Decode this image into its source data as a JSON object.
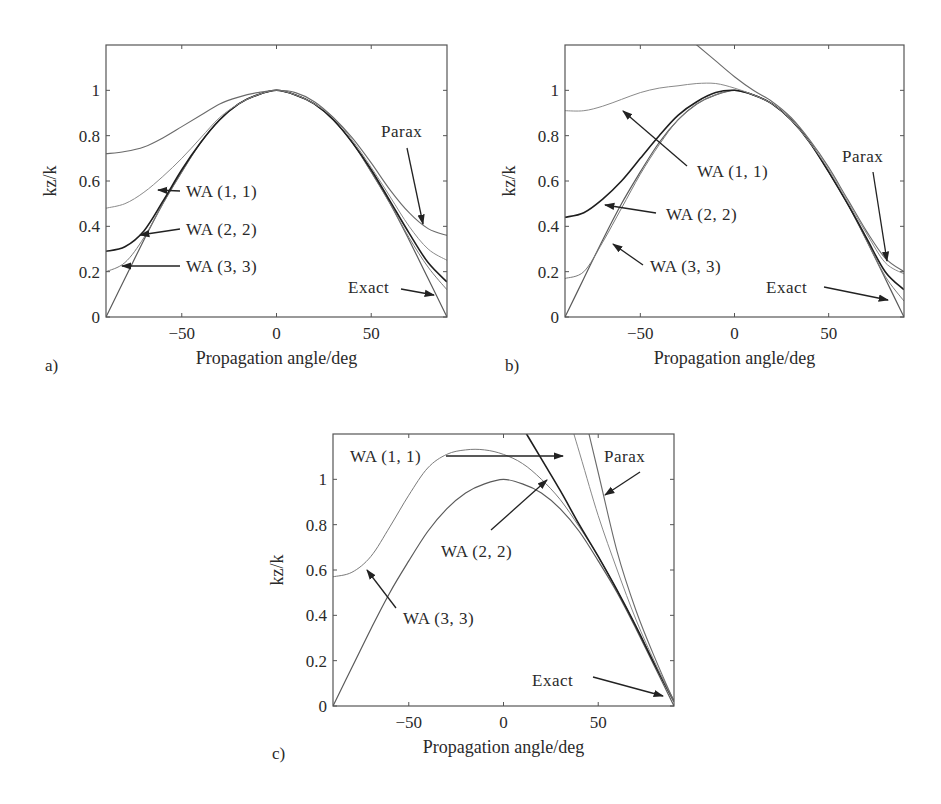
{
  "figure": {
    "panels": [
      {
        "id": "a",
        "letter": "a)",
        "xlabel": "Propagation angle/deg",
        "ylabel": "kz/k"
      },
      {
        "id": "b",
        "letter": "b)",
        "xlabel": "Propagation angle/deg",
        "ylabel": "kz/k"
      },
      {
        "id": "c",
        "letter": "c)",
        "xlabel": "Propagation angle/deg",
        "ylabel": "kz/k"
      }
    ]
  },
  "chart_data": [
    {
      "type": "line",
      "panel": "a)",
      "title": "",
      "xlabel": "Propagation angle/deg",
      "ylabel": "kz/k",
      "xlim": [
        -90,
        90
      ],
      "ylim": [
        0,
        1.2
      ],
      "xticks": [
        -50,
        0,
        50
      ],
      "yticks": [
        0,
        0.2,
        0.4,
        0.6,
        0.8,
        1
      ],
      "ytick_labels": [
        "0",
        "0.2",
        "0.4",
        "0.6",
        "0.8",
        "1"
      ],
      "grid": false,
      "x": [
        -90,
        -80,
        -70,
        -60,
        -50,
        -40,
        -30,
        -20,
        -10,
        0,
        10,
        20,
        30,
        40,
        50,
        60,
        70,
        80,
        90
      ],
      "series": [
        {
          "name": "Exact",
          "values": [
            0.0,
            0.17,
            0.34,
            0.5,
            0.64,
            0.77,
            0.87,
            0.94,
            0.98,
            1.0,
            0.98,
            0.94,
            0.87,
            0.77,
            0.64,
            0.5,
            0.34,
            0.17,
            0.0
          ]
        },
        {
          "name": "WA (3, 3)",
          "values": [
            0.2,
            0.24,
            0.35,
            0.5,
            0.64,
            0.77,
            0.87,
            0.94,
            0.98,
            1.0,
            0.98,
            0.94,
            0.87,
            0.77,
            0.64,
            0.5,
            0.35,
            0.22,
            0.12
          ]
        },
        {
          "name": "WA (2, 2)",
          "values": [
            0.29,
            0.31,
            0.38,
            0.51,
            0.65,
            0.77,
            0.87,
            0.94,
            0.98,
            1.0,
            0.98,
            0.94,
            0.87,
            0.77,
            0.65,
            0.51,
            0.37,
            0.24,
            0.155
          ]
        },
        {
          "name": "WA (1, 1)",
          "values": [
            0.48,
            0.5,
            0.55,
            0.62,
            0.7,
            0.79,
            0.88,
            0.94,
            0.98,
            1.0,
            0.98,
            0.94,
            0.88,
            0.78,
            0.66,
            0.53,
            0.4,
            0.3,
            0.25
          ]
        },
        {
          "name": "Parax",
          "values": [
            0.72,
            0.73,
            0.75,
            0.79,
            0.84,
            0.89,
            0.94,
            0.97,
            0.99,
            1.0,
            0.99,
            0.95,
            0.88,
            0.79,
            0.68,
            0.56,
            0.46,
            0.39,
            0.36
          ]
        }
      ],
      "annotations": [
        "WA (1, 1)",
        "WA (2, 2)",
        "WA (3, 3)",
        "Parax",
        "Exact"
      ]
    },
    {
      "type": "line",
      "panel": "b)",
      "title": "",
      "xlabel": "Propagation angle/deg",
      "ylabel": "kz/k",
      "xlim": [
        -90,
        90
      ],
      "ylim": [
        0,
        1.2
      ],
      "xticks": [
        -50,
        0,
        50
      ],
      "yticks": [
        0,
        0.2,
        0.4,
        0.6,
        0.8,
        1
      ],
      "ytick_labels": [
        "0",
        "0.2",
        "0.4",
        "0.6",
        "0.8",
        "1"
      ],
      "grid": false,
      "x": [
        -90,
        -80,
        -70,
        -60,
        -50,
        -40,
        -30,
        -20,
        -10,
        0,
        10,
        20,
        30,
        40,
        50,
        60,
        70,
        80,
        90
      ],
      "series": [
        {
          "name": "Exact",
          "values": [
            0.0,
            0.17,
            0.34,
            0.5,
            0.64,
            0.77,
            0.87,
            0.94,
            0.98,
            1.0,
            0.98,
            0.94,
            0.87,
            0.77,
            0.64,
            0.5,
            0.34,
            0.17,
            0.0
          ]
        },
        {
          "name": "WA (3, 3)",
          "values": [
            0.17,
            0.2,
            0.33,
            0.48,
            0.63,
            0.76,
            0.87,
            0.94,
            0.98,
            1.0,
            0.98,
            0.94,
            0.87,
            0.77,
            0.64,
            0.5,
            0.34,
            0.18,
            0.07
          ]
        },
        {
          "name": "WA (2, 2)",
          "values": [
            0.44,
            0.46,
            0.52,
            0.6,
            0.7,
            0.8,
            0.89,
            0.95,
            0.99,
            1.0,
            0.98,
            0.94,
            0.87,
            0.77,
            0.64,
            0.5,
            0.35,
            0.2,
            0.12
          ]
        },
        {
          "name": "WA (1, 1)",
          "values": [
            0.91,
            0.91,
            0.93,
            0.96,
            0.99,
            1.01,
            1.02,
            1.03,
            1.03,
            1.01,
            0.98,
            0.94,
            0.87,
            0.77,
            0.65,
            0.51,
            0.37,
            0.24,
            0.19
          ]
        },
        {
          "name": "Parax",
          "values": [
            null,
            null,
            null,
            null,
            null,
            null,
            null,
            1.2,
            1.13,
            1.06,
            1.0,
            0.95,
            0.88,
            0.78,
            0.66,
            0.52,
            0.38,
            0.26,
            0.2
          ]
        }
      ],
      "annotations": [
        "WA (1, 1)",
        "WA (2, 2)",
        "WA (3, 3)",
        "Parax",
        "Exact"
      ]
    },
    {
      "type": "line",
      "panel": "c)",
      "title": "",
      "xlabel": "Propagation angle/deg",
      "ylabel": "kz/k",
      "xlim": [
        -90,
        90
      ],
      "ylim": [
        0,
        1.2
      ],
      "xticks": [
        -50,
        0,
        50
      ],
      "yticks": [
        0,
        0.2,
        0.4,
        0.6,
        0.8,
        1
      ],
      "ytick_labels": [
        "0",
        "0.2",
        "0.4",
        "0.6",
        "0.8",
        "1"
      ],
      "grid": false,
      "x": [
        -90,
        -80,
        -70,
        -60,
        -50,
        -40,
        -30,
        -20,
        -10,
        0,
        10,
        20,
        30,
        40,
        50,
        60,
        70,
        80,
        90
      ],
      "series": [
        {
          "name": "Exact",
          "values": [
            0.0,
            0.17,
            0.34,
            0.5,
            0.64,
            0.77,
            0.87,
            0.94,
            0.98,
            1.0,
            0.98,
            0.94,
            0.87,
            0.77,
            0.64,
            0.5,
            0.34,
            0.17,
            0.0
          ]
        },
        {
          "name": "WA (3, 3)",
          "values": [
            0.57,
            0.59,
            0.66,
            0.79,
            0.93,
            1.05,
            1.11,
            1.13,
            1.13,
            1.11,
            1.07,
            1.0,
            0.91,
            0.79,
            0.66,
            0.51,
            0.35,
            0.18,
            0.02
          ]
        },
        {
          "name": "WA (2, 2)",
          "values": [
            null,
            null,
            null,
            null,
            null,
            null,
            null,
            null,
            null,
            null,
            null,
            1.09,
            0.95,
            0.8,
            0.66,
            0.51,
            0.35,
            0.18,
            0.02
          ]
        },
        {
          "name": "WA (1, 1)",
          "values": [
            null,
            null,
            null,
            null,
            null,
            null,
            null,
            null,
            null,
            null,
            null,
            null,
            null,
            1.12,
            0.84,
            0.6,
            0.38,
            0.19,
            0.02
          ]
        },
        {
          "name": "Parax",
          "values": [
            null,
            null,
            null,
            null,
            null,
            null,
            null,
            null,
            null,
            null,
            null,
            null,
            null,
            null,
            1.03,
            0.68,
            0.42,
            0.21,
            0.02
          ]
        }
      ],
      "annotations": [
        "WA (1, 1)",
        "WA (2, 2)",
        "WA (3, 3)",
        "Parax",
        "Exact"
      ]
    }
  ]
}
